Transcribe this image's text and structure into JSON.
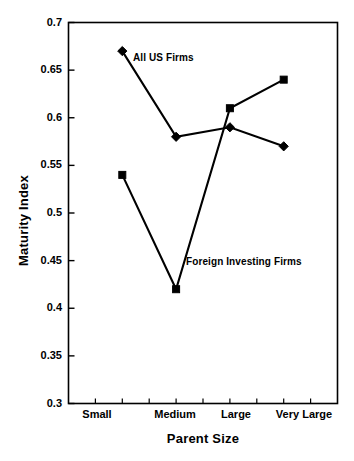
{
  "chart_data": {
    "type": "line",
    "title": "",
    "xlabel": "Parent Size",
    "ylabel": "Maturity Index",
    "categories": [
      "Small",
      "Medium",
      "Large",
      "Very Large"
    ],
    "ylim": [
      0.3,
      0.7
    ],
    "yticks": [
      "0.7",
      "0.65",
      "0.6",
      "0.55",
      "0.5",
      "0.45",
      "0.4",
      "0.35",
      "0.3"
    ],
    "ytick_values": [
      0.7,
      0.65,
      0.6,
      0.55,
      0.5,
      0.45,
      0.4,
      0.35,
      0.3
    ],
    "grid": false,
    "legend_position": "inline-annotations",
    "series": [
      {
        "name": "All US Firms",
        "marker": "diamond",
        "color": "#000000",
        "values": [
          0.67,
          0.58,
          0.59,
          0.57
        ]
      },
      {
        "name": "Foreign Investing Firms",
        "marker": "square",
        "color": "#000000",
        "values": [
          0.54,
          0.42,
          0.61,
          0.64
        ]
      }
    ],
    "annotations": [
      {
        "text": "All US Firms",
        "series": "All US Firms"
      },
      {
        "text": "Foreign Investing Firms",
        "series": "Foreign Investing Firms"
      }
    ]
  },
  "axis": {
    "y_title": "Maturity Index",
    "x_title": "Parent Size"
  },
  "ticks": {
    "y": [
      "0.7",
      "0.65",
      "0.6",
      "0.55",
      "0.5",
      "0.45",
      "0.4",
      "0.35",
      "0.3"
    ],
    "x": [
      "Small",
      "Medium",
      "Large",
      "Very Large"
    ]
  },
  "labels": {
    "all_us_firms": "All US Firms",
    "foreign_investing_firms": "Foreign Investing Firms"
  },
  "colors": {
    "line": "#000000",
    "axis": "#000000",
    "background": "#ffffff"
  }
}
